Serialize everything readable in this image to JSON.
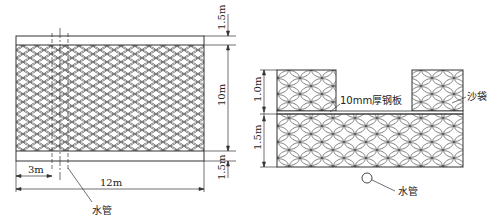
{
  "plan_view": {
    "dim_top": "1.5m",
    "dim_middle": "10m",
    "dim_bottom": "1.5m",
    "dim_offset": "3m",
    "dim_width": "12m",
    "pipe_label": "水管"
  },
  "section_view": {
    "dim_upper": "1.0m",
    "dim_lower": "1.5m",
    "plate_label": "10mm厚钢板",
    "sandbag_label": "沙袋",
    "pipe_label": "水管"
  },
  "colors": {
    "line": "#333333",
    "background": "#ffffff"
  }
}
